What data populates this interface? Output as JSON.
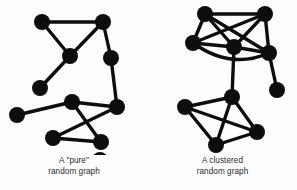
{
  "figure": {
    "background_color": "#fdfdfd",
    "node_color": "#0d0d0d",
    "edge_color": "#0d0d0d",
    "width": 297,
    "height": 190
  },
  "panels": {
    "left": {
      "caption_line1": "A \"pure\"",
      "caption_line2": "random graph",
      "node_count": 11,
      "edge_count": 11
    },
    "right": {
      "caption_line1": "A clustered",
      "caption_line2": "random graph",
      "node_count": 10,
      "edge_count": 18
    }
  },
  "chart_data": [
    {
      "type": "scatter",
      "title": "A \"pure\" random graph",
      "xlabel": "",
      "ylabel": "",
      "xlim": [
        0,
        148
      ],
      "ylim": [
        0,
        190
      ],
      "grid": false,
      "legend": "none",
      "node_radius": 8,
      "nodes": [
        {
          "id": "L1",
          "x": 42,
          "y": 22
        },
        {
          "id": "L2",
          "x": 103,
          "y": 22
        },
        {
          "id": "L3",
          "x": 70,
          "y": 56
        },
        {
          "id": "L4",
          "x": 111,
          "y": 58
        },
        {
          "id": "L5",
          "x": 40,
          "y": 88
        },
        {
          "id": "L6",
          "x": 17,
          "y": 115
        },
        {
          "id": "L7",
          "x": 72,
          "y": 102
        },
        {
          "id": "L8",
          "x": 117,
          "y": 107
        },
        {
          "id": "L9",
          "x": 53,
          "y": 138
        },
        {
          "id": "L10",
          "x": 101,
          "y": 142
        },
        {
          "id": "L11",
          "x": 100,
          "y": 160
        }
      ],
      "edges": [
        [
          "L1",
          "L2"
        ],
        [
          "L1",
          "L3"
        ],
        [
          "L2",
          "L3"
        ],
        [
          "L2",
          "L4"
        ],
        [
          "L4",
          "L8"
        ],
        [
          "L3",
          "L5"
        ],
        [
          "L6",
          "L7"
        ],
        [
          "L7",
          "L8"
        ],
        [
          "L7",
          "L10"
        ],
        [
          "L8",
          "L9"
        ],
        [
          "L9",
          "L10"
        ]
      ]
    },
    {
      "type": "scatter",
      "title": "A clustered random graph",
      "xlabel": "",
      "ylabel": "",
      "xlim": [
        0,
        149
      ],
      "ylim": [
        0,
        190
      ],
      "grid": false,
      "legend": "none",
      "node_radius": 8,
      "nodes": [
        {
          "id": "R1",
          "x": 57,
          "y": 14
        },
        {
          "id": "R2",
          "x": 117,
          "y": 14
        },
        {
          "id": "R3",
          "x": 45,
          "y": 43
        },
        {
          "id": "R4",
          "x": 86,
          "y": 47
        },
        {
          "id": "R5",
          "x": 121,
          "y": 53
        },
        {
          "id": "R6",
          "x": 129,
          "y": 90
        },
        {
          "id": "R7",
          "x": 84,
          "y": 97
        },
        {
          "id": "R8",
          "x": 37,
          "y": 107
        },
        {
          "id": "R9",
          "x": 109,
          "y": 132
        },
        {
          "id": "R10",
          "x": 68,
          "y": 145
        }
      ],
      "edges": [
        [
          "R1",
          "R2"
        ],
        [
          "R1",
          "R3"
        ],
        [
          "R1",
          "R4"
        ],
        [
          "R1",
          "R5"
        ],
        [
          "R2",
          "R3"
        ],
        [
          "R2",
          "R4"
        ],
        [
          "R2",
          "R5"
        ],
        [
          "R3",
          "R4"
        ],
        [
          "R3",
          "R5"
        ],
        [
          "R4",
          "R5"
        ],
        [
          "R4",
          "R7"
        ],
        [
          "R5",
          "R6"
        ],
        [
          "R7",
          "R8"
        ],
        [
          "R7",
          "R9"
        ],
        [
          "R7",
          "R10"
        ],
        [
          "R8",
          "R9"
        ],
        [
          "R8",
          "R10"
        ],
        [
          "R9",
          "R10"
        ]
      ],
      "curved_edges": [
        {
          "from": "R3",
          "to": "R5",
          "bow": 22
        }
      ]
    }
  ]
}
